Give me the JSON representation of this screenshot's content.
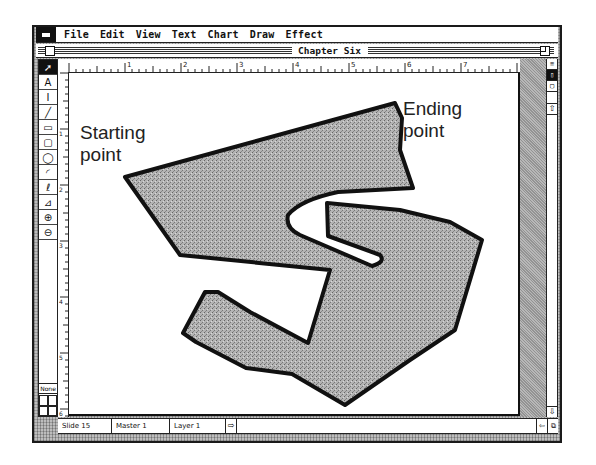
{
  "menubar": {
    "apple_icon": "apple-menu-icon",
    "items": [
      "File",
      "Edit",
      "View",
      "Text",
      "Chart",
      "Draw",
      "Effect"
    ]
  },
  "window": {
    "title": "Chapter Six"
  },
  "toolbox": {
    "tools": [
      {
        "name": "pointer",
        "glyph": "➚",
        "selected": true
      },
      {
        "name": "text",
        "glyph": "A",
        "selected": false
      },
      {
        "name": "label",
        "glyph": "I",
        "selected": false
      },
      {
        "name": "line",
        "glyph": "╱",
        "selected": false
      },
      {
        "name": "rectangle",
        "glyph": "▭",
        "selected": false
      },
      {
        "name": "rounded-rectangle",
        "glyph": "▢",
        "selected": false
      },
      {
        "name": "oval",
        "glyph": "◯",
        "selected": false
      },
      {
        "name": "arc",
        "glyph": "◜",
        "selected": false
      },
      {
        "name": "freehand",
        "glyph": "ℓ",
        "selected": false
      },
      {
        "name": "polygon",
        "glyph": "⊿",
        "selected": false
      },
      {
        "name": "zoom-in",
        "glyph": "⊕",
        "selected": false
      },
      {
        "name": "zoom-out",
        "glyph": "⊖",
        "selected": false
      }
    ],
    "fill_label": "None"
  },
  "rulers": {
    "horizontal_labels": [
      "1",
      "2",
      "3",
      "4",
      "5",
      "6",
      "7"
    ],
    "vertical_labels": [
      "1",
      "2",
      "3",
      "4",
      "5",
      "6"
    ]
  },
  "right_panel": {
    "tools": [
      "≡",
      "▯",
      "▢"
    ]
  },
  "canvas": {
    "start_label_line1": "Starting",
    "start_label_line2": "point",
    "end_label_line1": "Ending",
    "end_label_line2": "point",
    "shape_fill": "#a8a8a8",
    "shape_stroke": "#111111"
  },
  "statusbar": {
    "slide": "Slide 15",
    "master": "Master 1",
    "layer": "Layer 1"
  }
}
